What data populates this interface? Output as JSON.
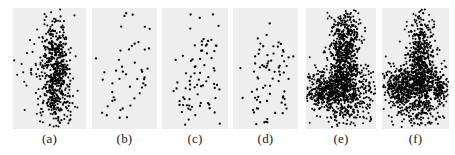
{
  "figure": {
    "type": "multi-panel-scatter-figure",
    "panel_count": 6,
    "background_color": "#ffffff",
    "panel_background_color": "#eeeeee",
    "point_color": "#000000",
    "tick_color": "#c9c9c9"
  },
  "chart_data": [
    {
      "type": "scatter",
      "title": "(a)",
      "label": "(a)",
      "xlabel": "",
      "ylabel": "",
      "xlim": [
        0,
        1
      ],
      "ylim": [
        0,
        1
      ],
      "grid": false,
      "legend": "none",
      "n_points": 620,
      "marker_size_px": 2.1,
      "density": "very-dense",
      "shape": "vertical elongated cluster right of centre with sparse outliers to the left and tail at bottom",
      "clusters": [
        {
          "cx": 0.58,
          "cy": 0.47,
          "sx": 0.085,
          "sy": 0.2,
          "n": 380
        },
        {
          "cx": 0.6,
          "cy": 0.3,
          "sx": 0.11,
          "sy": 0.12,
          "n": 120
        },
        {
          "cx": 0.55,
          "cy": 0.72,
          "sx": 0.12,
          "sy": 0.1,
          "n": 70
        },
        {
          "cx": 0.3,
          "cy": 0.42,
          "sx": 0.19,
          "sy": 0.12,
          "n": 30
        },
        {
          "cx": 0.55,
          "cy": 0.12,
          "sx": 0.14,
          "sy": 0.06,
          "n": 20
        }
      ],
      "x_ticks": [
        0.08,
        0.33,
        0.58,
        0.83
      ],
      "y_ticks": [
        0.05,
        0.26,
        0.47,
        0.68,
        0.89
      ]
    },
    {
      "type": "scatter",
      "title": "(b)",
      "label": "(b)",
      "xlabel": "",
      "ylabel": "",
      "xlim": [
        0,
        1
      ],
      "ylim": [
        0,
        1
      ],
      "grid": false,
      "legend": "none",
      "n_points": 52,
      "marker_size_px": 2.3,
      "density": "sparse",
      "shape": "diffuse scatter, slight diagonal band from lower-left to upper-right",
      "clusters": [
        {
          "cx": 0.62,
          "cy": 0.55,
          "sx": 0.17,
          "sy": 0.22,
          "n": 26
        },
        {
          "cx": 0.34,
          "cy": 0.36,
          "sx": 0.16,
          "sy": 0.18,
          "n": 14
        },
        {
          "cx": 0.45,
          "cy": 0.13,
          "sx": 0.07,
          "sy": 0.06,
          "n": 6
        },
        {
          "cx": 0.82,
          "cy": 0.34,
          "sx": 0.07,
          "sy": 0.18,
          "n": 6
        }
      ],
      "x_ticks": [
        0.08,
        0.33,
        0.58,
        0.83
      ],
      "y_ticks": [
        0.05,
        0.26,
        0.47,
        0.68,
        0.89
      ]
    },
    {
      "type": "scatter",
      "title": "(c)",
      "label": "(c)",
      "xlabel": "",
      "ylabel": "",
      "xlim": [
        0,
        1
      ],
      "ylim": [
        0,
        1
      ],
      "grid": false,
      "legend": "none",
      "n_points": 78,
      "marker_size_px": 2.3,
      "density": "sparse",
      "shape": "loose scatter with a mild central band and a short descending string at bottom-left",
      "clusters": [
        {
          "cx": 0.6,
          "cy": 0.56,
          "sx": 0.15,
          "sy": 0.22,
          "n": 38
        },
        {
          "cx": 0.38,
          "cy": 0.37,
          "sx": 0.15,
          "sy": 0.16,
          "n": 20
        },
        {
          "cx": 0.37,
          "cy": 0.13,
          "sx": 0.08,
          "sy": 0.07,
          "n": 10
        },
        {
          "cx": 0.82,
          "cy": 0.4,
          "sx": 0.07,
          "sy": 0.2,
          "n": 10
        }
      ],
      "x_ticks": [
        0.08,
        0.33,
        0.58,
        0.83
      ],
      "y_ticks": [
        0.05,
        0.26,
        0.47,
        0.68,
        0.89
      ]
    },
    {
      "type": "scatter",
      "title": "(d)",
      "label": "(d)",
      "xlabel": "",
      "ylabel": "",
      "xlim": [
        0,
        1
      ],
      "ylim": [
        0,
        1
      ],
      "grid": false,
      "legend": "none",
      "n_points": 74,
      "marker_size_px": 2.3,
      "density": "sparse",
      "shape": "loose scatter concentrated right of centre with a diagonal streak at lower-left",
      "clusters": [
        {
          "cx": 0.63,
          "cy": 0.57,
          "sx": 0.14,
          "sy": 0.21,
          "n": 36
        },
        {
          "cx": 0.36,
          "cy": 0.38,
          "sx": 0.15,
          "sy": 0.16,
          "n": 18
        },
        {
          "cx": 0.42,
          "cy": 0.14,
          "sx": 0.07,
          "sy": 0.07,
          "n": 10
        },
        {
          "cx": 0.8,
          "cy": 0.36,
          "sx": 0.08,
          "sy": 0.18,
          "n": 10
        }
      ],
      "x_ticks": [
        0.08,
        0.33,
        0.58,
        0.83
      ],
      "y_ticks": [
        0.05,
        0.26,
        0.47,
        0.68,
        0.89
      ]
    },
    {
      "type": "scatter",
      "title": "(e)",
      "label": "(e)",
      "xlabel": "",
      "ylabel": "",
      "xlim": [
        0,
        1
      ],
      "ylim": [
        0,
        1
      ],
      "grid": false,
      "legend": "none",
      "n_points": 1500,
      "marker_size_px": 2.0,
      "density": "saturated",
      "shape": "mushroom / anvil: tall dense column upper-centre widening into a broad horizontal saturated band across the lower third",
      "clusters": [
        {
          "cx": 0.55,
          "cy": 0.6,
          "sx": 0.1,
          "sy": 0.17,
          "n": 520
        },
        {
          "cx": 0.52,
          "cy": 0.33,
          "sx": 0.22,
          "sy": 0.1,
          "n": 560
        },
        {
          "cx": 0.25,
          "cy": 0.31,
          "sx": 0.11,
          "sy": 0.07,
          "n": 200
        },
        {
          "cx": 0.58,
          "cy": 0.82,
          "sx": 0.09,
          "sy": 0.09,
          "n": 120
        },
        {
          "cx": 0.6,
          "cy": 0.16,
          "sx": 0.2,
          "sy": 0.07,
          "n": 100
        }
      ],
      "x_ticks": [
        0.08,
        0.33,
        0.58,
        0.83
      ],
      "y_ticks": [
        0.05,
        0.26,
        0.47,
        0.68,
        0.89
      ]
    },
    {
      "type": "scatter",
      "title": "(f)",
      "label": "(f)",
      "xlabel": "",
      "ylabel": "",
      "xlim": [
        0,
        1
      ],
      "ylim": [
        0,
        1
      ],
      "grid": false,
      "legend": "none",
      "n_points": 1400,
      "marker_size_px": 2.0,
      "density": "saturated",
      "shape": "cross / plus: dense vertical column through the centre crossed by a wide saturated horizontal band at lower-middle, blob extending to the left",
      "clusters": [
        {
          "cx": 0.58,
          "cy": 0.62,
          "sx": 0.1,
          "sy": 0.18,
          "n": 480
        },
        {
          "cx": 0.52,
          "cy": 0.36,
          "sx": 0.21,
          "sy": 0.09,
          "n": 480
        },
        {
          "cx": 0.22,
          "cy": 0.34,
          "sx": 0.1,
          "sy": 0.1,
          "n": 210
        },
        {
          "cx": 0.85,
          "cy": 0.33,
          "sx": 0.07,
          "sy": 0.06,
          "n": 90
        },
        {
          "cx": 0.55,
          "cy": 0.15,
          "sx": 0.17,
          "sy": 0.07,
          "n": 140
        }
      ],
      "x_ticks": [
        0.08,
        0.33,
        0.58,
        0.83
      ],
      "y_ticks": [
        0.05,
        0.26,
        0.47,
        0.68,
        0.89
      ]
    }
  ],
  "panel_geometry": [
    {
      "left": 13,
      "width": 73
    },
    {
      "left": 92,
      "width": 65
    },
    {
      "left": 162,
      "width": 66
    },
    {
      "left": 233,
      "width": 65
    },
    {
      "left": 306,
      "width": 70
    },
    {
      "left": 382,
      "width": 67
    }
  ]
}
